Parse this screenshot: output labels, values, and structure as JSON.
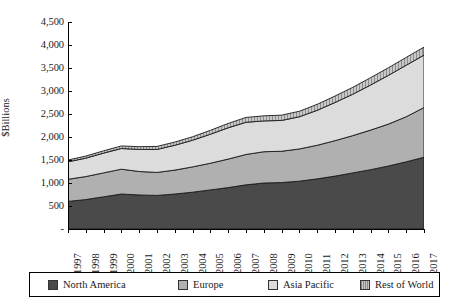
{
  "chart_data": {
    "type": "area",
    "stacked": true,
    "title": "",
    "xlabel": "",
    "ylabel": "$Billions",
    "ylim": [
      0,
      4500
    ],
    "ytick_values": [
      0,
      500,
      1000,
      1500,
      2000,
      2500,
      3000,
      3500,
      4000,
      4500
    ],
    "ytick_labels": [
      "-",
      "500",
      "1,000",
      "1,500",
      "2,000",
      "2,500",
      "3,000",
      "3,500",
      "4,000",
      "4,500"
    ],
    "grid": false,
    "legend_position": "bottom",
    "categories": [
      "1997",
      "1998",
      "1999",
      "2000",
      "2001",
      "2002",
      "2003",
      "2004",
      "2005",
      "2006",
      "2007",
      "2008",
      "2009",
      "2010",
      "2011",
      "2012",
      "2013",
      "2014",
      "2015",
      "2016",
      "2017"
    ],
    "series": [
      {
        "name": "North America",
        "color": "#4a4a4a",
        "values": [
          600,
          640,
          700,
          760,
          740,
          730,
          760,
          800,
          850,
          900,
          960,
          1000,
          1010,
          1040,
          1090,
          1150,
          1220,
          1290,
          1370,
          1460,
          1560
        ]
      },
      {
        "name": "Europe",
        "color": "#b0b0b0",
        "values": [
          480,
          500,
          520,
          540,
          510,
          500,
          520,
          550,
          580,
          620,
          660,
          680,
          680,
          700,
          730,
          770,
          810,
          860,
          910,
          980,
          1080
        ]
      },
      {
        "name": "Asia Pacific",
        "color": "#dcdcdc",
        "values": [
          380,
          400,
          430,
          450,
          480,
          500,
          540,
          580,
          630,
          680,
          700,
          670,
          670,
          700,
          760,
          830,
          900,
          980,
          1060,
          1120,
          1140
        ]
      },
      {
        "name": "Rest of World",
        "color": "#c4c4c4",
        "pattern": "hatched",
        "values": [
          40,
          45,
          50,
          55,
          60,
          65,
          70,
          75,
          85,
          95,
          105,
          110,
          115,
          120,
          130,
          140,
          150,
          160,
          165,
          170,
          175
        ]
      }
    ],
    "totals": [
      1500,
      1585,
      1700,
      1805,
      1790,
      1795,
      1890,
      2005,
      2145,
      2295,
      2425,
      2460,
      2475,
      2560,
      2710,
      2890,
      3080,
      3290,
      3505,
      3730,
      3955
    ]
  },
  "legend": {
    "items": [
      {
        "label": "North America",
        "swatch": "sw-na"
      },
      {
        "label": "Europe",
        "swatch": "sw-eu"
      },
      {
        "label": "Asia Pacific",
        "swatch": "sw-ap"
      },
      {
        "label": "Rest of World",
        "swatch": "sw-rw"
      }
    ]
  }
}
